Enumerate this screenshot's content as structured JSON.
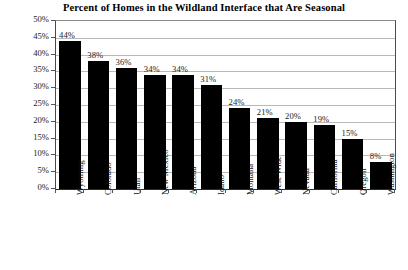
{
  "chart_data": {
    "type": "bar",
    "title": "Percent of Homes in the Wildland Interface that Are Seasonal",
    "xlabel": "",
    "ylabel": "Percent Seasonal",
    "ylim": [
      0,
      50
    ],
    "ytick_step": 5,
    "grid": true,
    "legend": null,
    "bar_color": "#000000",
    "categories": [
      "Wyoming",
      "Colorado",
      "Utah",
      "New Mexico",
      "Arizona",
      "Idaho",
      "Montana",
      "West-Wide",
      "Nevada",
      "California",
      "Oregon",
      "Washington"
    ],
    "values": [
      44,
      38,
      36,
      34,
      34,
      31,
      24,
      21,
      20,
      19,
      15,
      8
    ],
    "data_labels": [
      "44%",
      "38%",
      "36%",
      "34%",
      "34%",
      "31%",
      "24%",
      "21%",
      "20%",
      "19%",
      "15%",
      "8%"
    ],
    "ytick_labels": [
      "50%",
      "45%",
      "40%",
      "35%",
      "30%",
      "25%",
      "20%",
      "15%",
      "10%",
      "5%",
      "0%"
    ],
    "ytick_values": [
      50,
      45,
      40,
      35,
      30,
      25,
      20,
      15,
      10,
      5,
      0
    ]
  }
}
